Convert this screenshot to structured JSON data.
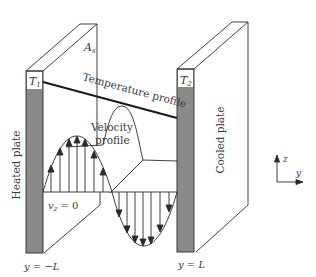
{
  "diagram": {
    "colors": {
      "plate_fill": "#8a8a8a",
      "line": "#2a2a2a",
      "text": "#3a3a3a",
      "background": "#ffffff"
    },
    "labels": {
      "area": "A",
      "area_sub": "s",
      "t1": "T",
      "t1_sub": "1",
      "t2": "T",
      "t2_sub": "2",
      "temperature_profile": "Temperature profile",
      "velocity_profile_line1": "Velocity",
      "velocity_profile_line2": "profile",
      "vz_zero": "v",
      "vz_sub": "z",
      "vz_eq": " = 0",
      "heated_plate": "Heated plate",
      "cooled_plate": "Cooled plate",
      "y_left": "y = −L",
      "y_right": "y = L",
      "axis_z": "z",
      "axis_y": "y"
    },
    "components": [
      "heated-plate",
      "cooled-plate",
      "temperature-profile-line",
      "velocity-profile-up-lobe",
      "velocity-profile-down-lobe",
      "axis-indicator"
    ]
  }
}
